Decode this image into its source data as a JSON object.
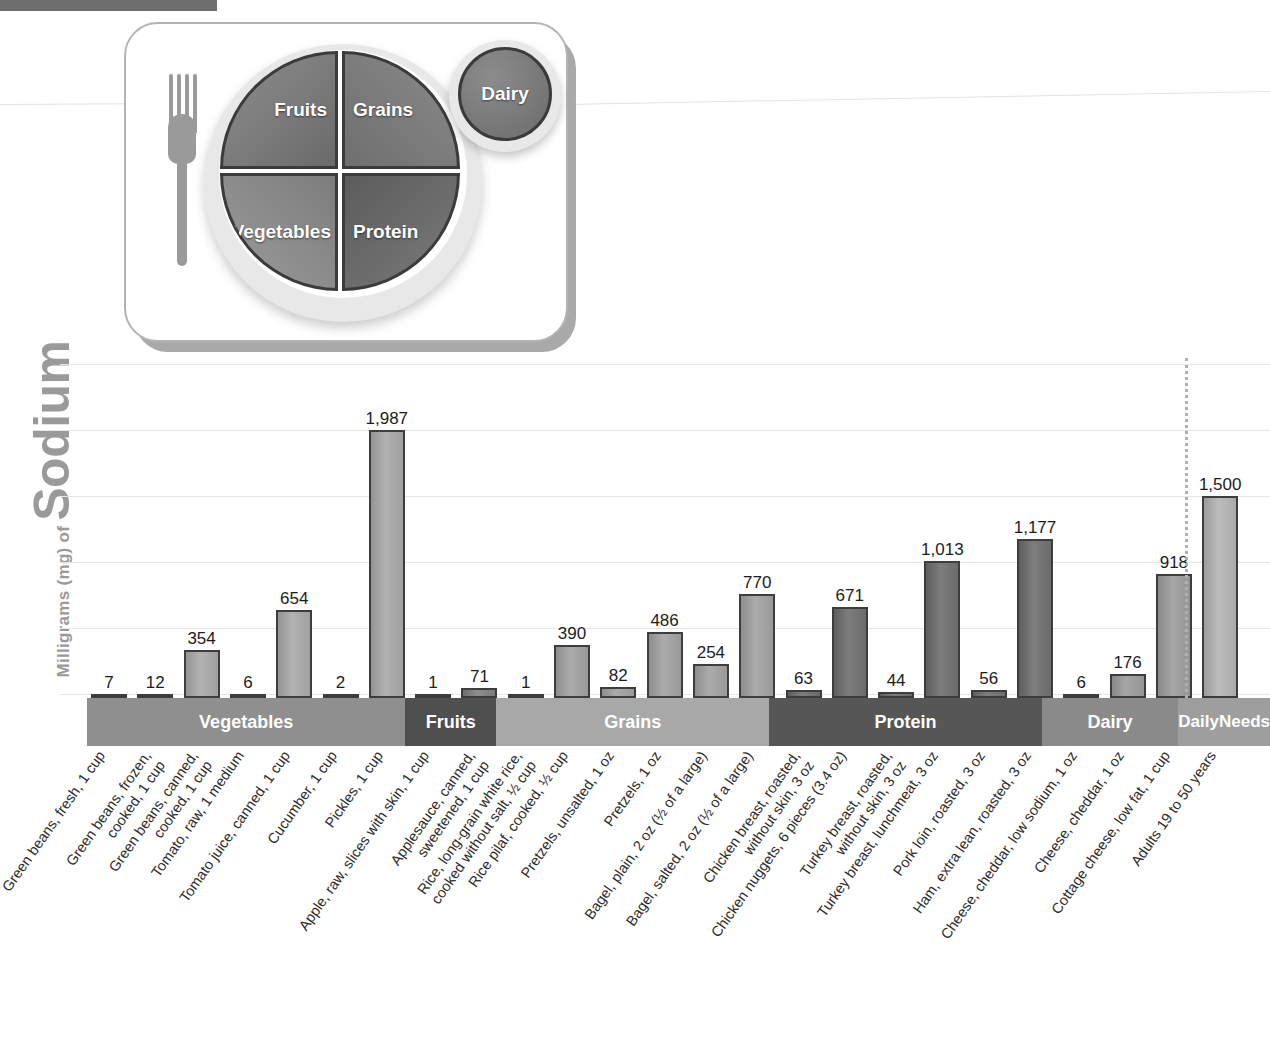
{
  "header": {
    "strip_color": "#6e6e6e"
  },
  "myplate": {
    "title": "MyPlate",
    "segments": [
      {
        "name": "fruits",
        "label": "Fruits"
      },
      {
        "name": "grains",
        "label": "Grains"
      },
      {
        "name": "vegetables",
        "label": "Vegetables"
      },
      {
        "name": "protein",
        "label": "Protein"
      },
      {
        "name": "dairy",
        "label": "Dairy"
      }
    ]
  },
  "axis": {
    "y_unit": "Milligrams (mg) of ",
    "y_nutrient": "Sodium"
  },
  "chart_data": {
    "type": "bar",
    "title": "",
    "xlabel": "",
    "ylabel": "Milligrams (mg) of Sodium",
    "ylim": [
      0,
      2100
    ],
    "grid": true,
    "legend_position": "none",
    "value_unit": "mg",
    "categories": [
      "Green beans, fresh, 1 cup",
      "Green beans, frozen, cooked, 1 cup",
      "Green beans, canned, cooked, 1 cup",
      "Tomato, raw, 1 medium",
      "Tomato juice, canned, 1 cup",
      "Cucumber, 1 cup",
      "Pickles, 1 cup",
      "Apple, raw, slices with skin, 1 cup",
      "Applesauce, canned, sweetened, 1 cup",
      "Rice, long-grain white rice, cooked without salt, 1/2 cup",
      "Rice pilaf, cooked, 1/2 cup",
      "Pretzels, unsalted, 1 oz",
      "Pretzels, 1 oz",
      "Bagel, plain, 2 oz (1/2 of a large)",
      "Bagel, salted, 2 oz (1/2 of a large)",
      "Chicken breast, roasted, without skin, 3 oz",
      "Chicken nuggets, 6 pieces (3.4 oz)",
      "Turkey breast, roasted, without skin, 3 oz",
      "Turkey breast, lunchmeat, 3 oz",
      "Pork loin, roasted, 3 oz",
      "Ham, extra lean, roasted, 3 oz",
      "Cheese, cheddar, low sodium, 1 oz",
      "Cheese, cheddar, 1 oz",
      "Cottage cheese, low fat, 1 cup",
      "Adults 19 to 50 years"
    ],
    "values": [
      7,
      12,
      354,
      6,
      654,
      2,
      1987,
      1,
      71,
      1,
      390,
      82,
      486,
      254,
      770,
      63,
      671,
      44,
      1013,
      56,
      1177,
      6,
      176,
      918,
      1500
    ],
    "value_labels": [
      "7",
      "12",
      "354",
      "6",
      "654",
      "2",
      "1,987",
      "1",
      "71",
      "1",
      "390",
      "82",
      "486",
      "254",
      "770",
      "63",
      "671",
      "44",
      "1,013",
      "56",
      "1,177",
      "6",
      "176",
      "918",
      "1,500"
    ],
    "groups": [
      {
        "name": "vegetables",
        "label": "Vegetables",
        "color": "#8f8f8f",
        "bar_tone": "tone-veg",
        "start": 0,
        "count": 7
      },
      {
        "name": "fruits",
        "label": "Fruits",
        "color": "#4f4f4f",
        "bar_tone": "tone-fruit",
        "start": 7,
        "count": 2
      },
      {
        "name": "grains",
        "label": "Grains",
        "color": "#a8a8a8",
        "bar_tone": "tone-grain",
        "start": 9,
        "count": 6
      },
      {
        "name": "protein",
        "label": "Protein",
        "color": "#565656",
        "bar_tone": "tone-prot",
        "start": 15,
        "count": 6
      },
      {
        "name": "dairy",
        "label": "Dairy",
        "color": "#8a8a8a",
        "bar_tone": "tone-dairy",
        "start": 21,
        "count": 3
      },
      {
        "name": "daily-needs",
        "label": "Daily\nNeeds",
        "color": "#9e9e9e",
        "bar_tone": "tone-needs",
        "start": 24,
        "count": 1
      }
    ],
    "x_label_lines": [
      [
        "Green beans, fresh, 1 cup"
      ],
      [
        "Green beans, frozen,",
        "cooked, 1 cup"
      ],
      [
        "Green beans, canned,",
        "cooked, 1 cup"
      ],
      [
        "Tomato, raw, 1 medium"
      ],
      [
        "Tomato juice, canned, 1 cup"
      ],
      [
        "Cucumber, 1 cup"
      ],
      [
        "Pickles, 1 cup"
      ],
      [
        "Apple, raw, slices with skin, 1 cup"
      ],
      [
        "Applesauce, canned,",
        "sweetened, 1 cup"
      ],
      [
        "Rice, long-grain white rice,",
        "cooked without salt, ½ cup"
      ],
      [
        "Rice pilaf, cooked, ½ cup"
      ],
      [
        "Pretzels, unsalted, 1 oz"
      ],
      [
        "Pretzels, 1 oz"
      ],
      [
        "Bagel, plain, 2 oz (½ of a large)"
      ],
      [
        "Bagel, salted, 2 oz (½ of a large)"
      ],
      [
        "Chicken breast, roasted,",
        "without skin, 3 oz"
      ],
      [
        "Chicken nuggets, 6 pieces (3.4 oz)"
      ],
      [
        "Turkey breast, roasted,",
        "without skin, 3 oz"
      ],
      [
        "Turkey breast, lunchmeat, 3 oz"
      ],
      [
        "Pork loin, roasted, 3 oz"
      ],
      [
        "Ham, extra lean, roasted, 3 oz"
      ],
      [
        "Cheese, cheddar, low sodium, 1 oz"
      ],
      [
        "Cheese, cheddar, 1 oz"
      ],
      [
        "Cottage cheese, low fat, 1 cup"
      ],
      [
        "Adults 19 to 50 years"
      ]
    ]
  }
}
